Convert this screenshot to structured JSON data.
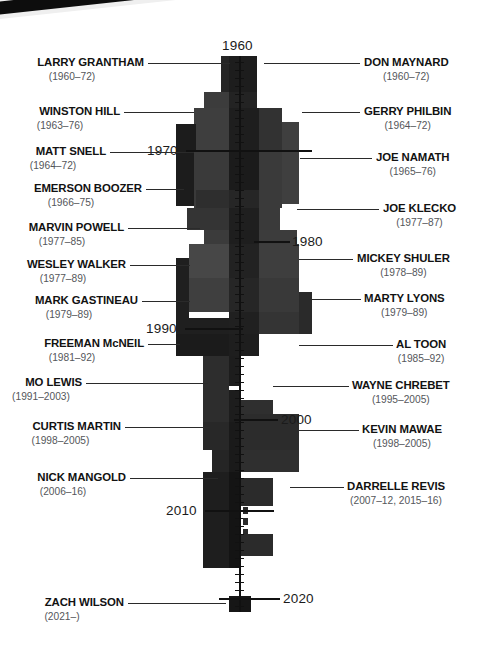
{
  "meta": {
    "domain": "chart",
    "background": "#ffffff",
    "accent": "#111111"
  },
  "chart_data": {
    "type": "area",
    "title": "",
    "xlabel": "",
    "ylabel": "Year",
    "orientation": "vertical-stream",
    "axis_years": [
      {
        "label": "1960",
        "side": "top",
        "y": 45
      },
      {
        "label": "1970",
        "side": "left",
        "y": 150
      },
      {
        "label": "1980",
        "side": "right",
        "y": 241
      },
      {
        "label": "1990",
        "side": "left",
        "y": 328
      },
      {
        "label": "2000",
        "side": "right",
        "y": 419
      },
      {
        "label": "2010",
        "side": "left",
        "y": 510
      },
      {
        "label": "2020",
        "side": "right",
        "y": 598
      }
    ],
    "ylim": [
      1960,
      2022
    ],
    "grid": false,
    "legend": "none",
    "series_note": "stacked career-span stream, widths in px",
    "bands": [
      {
        "x": 229,
        "y": 56,
        "w": 28,
        "h": 36,
        "c": "#1d1d1d"
      },
      {
        "x": 221,
        "y": 56,
        "w": 8,
        "h": 36,
        "c": "#252525"
      },
      {
        "x": 229,
        "y": 92,
        "w": 28,
        "h": 16,
        "c": "#232323"
      },
      {
        "x": 204,
        "y": 92,
        "w": 25,
        "h": 16,
        "c": "#3c3c3c"
      },
      {
        "x": 257,
        "y": 108,
        "w": 25,
        "h": 16,
        "c": "#3a3a3a"
      },
      {
        "x": 194,
        "y": 108,
        "w": 35,
        "h": 44,
        "c": "#3e3e3e"
      },
      {
        "x": 229,
        "y": 108,
        "w": 30,
        "h": 44,
        "c": "#1e1e1e"
      },
      {
        "x": 259,
        "y": 108,
        "w": 23,
        "h": 44,
        "c": "#323232"
      },
      {
        "x": 282,
        "y": 122,
        "w": 17,
        "h": 82,
        "c": "#3f3f3f"
      },
      {
        "x": 176,
        "y": 124,
        "w": 20,
        "h": 82,
        "c": "#1c1c1c"
      },
      {
        "x": 194,
        "y": 152,
        "w": 35,
        "h": 56,
        "c": "#3a3a3a"
      },
      {
        "x": 229,
        "y": 152,
        "w": 30,
        "h": 38,
        "c": "#1b1b1b"
      },
      {
        "x": 259,
        "y": 152,
        "w": 23,
        "h": 56,
        "c": "#3a3a3a"
      },
      {
        "x": 196,
        "y": 190,
        "w": 33,
        "h": 18,
        "c": "#2e2e2e"
      },
      {
        "x": 229,
        "y": 190,
        "w": 30,
        "h": 18,
        "c": "#262626"
      },
      {
        "x": 187,
        "y": 208,
        "w": 42,
        "h": 22,
        "c": "#343434"
      },
      {
        "x": 229,
        "y": 208,
        "w": 30,
        "h": 22,
        "c": "#1f1f1f"
      },
      {
        "x": 259,
        "y": 208,
        "w": 21,
        "h": 22,
        "c": "#3a3a3a"
      },
      {
        "x": 204,
        "y": 230,
        "w": 25,
        "h": 14,
        "c": "#3b3b3b"
      },
      {
        "x": 229,
        "y": 230,
        "w": 30,
        "h": 14,
        "c": "#1e1e1e"
      },
      {
        "x": 259,
        "y": 230,
        "w": 38,
        "h": 14,
        "c": "#3c3c3c"
      },
      {
        "x": 189,
        "y": 244,
        "w": 40,
        "h": 34,
        "c": "#474747"
      },
      {
        "x": 229,
        "y": 244,
        "w": 30,
        "h": 34,
        "c": "#222222"
      },
      {
        "x": 259,
        "y": 244,
        "w": 40,
        "h": 34,
        "c": "#3e3e3e"
      },
      {
        "x": 176,
        "y": 258,
        "w": 13,
        "h": 60,
        "c": "#1f1f1f"
      },
      {
        "x": 189,
        "y": 278,
        "w": 40,
        "h": 34,
        "c": "#3f3f3f"
      },
      {
        "x": 229,
        "y": 278,
        "w": 30,
        "h": 34,
        "c": "#262626"
      },
      {
        "x": 259,
        "y": 278,
        "w": 40,
        "h": 34,
        "c": "#393939"
      },
      {
        "x": 299,
        "y": 292,
        "w": 13,
        "h": 42,
        "c": "#2a2a2a"
      },
      {
        "x": 176,
        "y": 318,
        "w": 53,
        "h": 16,
        "c": "#1f1f1f"
      },
      {
        "x": 229,
        "y": 312,
        "w": 30,
        "h": 22,
        "c": "#202020"
      },
      {
        "x": 259,
        "y": 312,
        "w": 40,
        "h": 22,
        "c": "#343434"
      },
      {
        "x": 176,
        "y": 334,
        "w": 53,
        "h": 22,
        "c": "#1b1b1b"
      },
      {
        "x": 229,
        "y": 334,
        "w": 30,
        "h": 22,
        "c": "#1e1e1e"
      },
      {
        "x": 203,
        "y": 356,
        "w": 26,
        "h": 66,
        "c": "#2d2d2d"
      },
      {
        "x": 229,
        "y": 356,
        "w": 12,
        "h": 30,
        "c": "#1d1d1d"
      },
      {
        "x": 229,
        "y": 390,
        "w": 12,
        "h": 32,
        "c": "#1d1d1d"
      },
      {
        "x": 241,
        "y": 400,
        "w": 32,
        "h": 22,
        "c": "#2f2f2f"
      },
      {
        "x": 203,
        "y": 422,
        "w": 26,
        "h": 28,
        "c": "#282828"
      },
      {
        "x": 229,
        "y": 422,
        "w": 12,
        "h": 28,
        "c": "#1a1a1a"
      },
      {
        "x": 241,
        "y": 414,
        "w": 58,
        "h": 36,
        "c": "#2c2c2c"
      },
      {
        "x": 212,
        "y": 450,
        "w": 17,
        "h": 22,
        "c": "#252525"
      },
      {
        "x": 229,
        "y": 450,
        "w": 12,
        "h": 22,
        "c": "#1a1a1a"
      },
      {
        "x": 241,
        "y": 450,
        "w": 58,
        "h": 22,
        "c": "#2f2f2f"
      },
      {
        "x": 203,
        "y": 472,
        "w": 26,
        "h": 96,
        "c": "#1e1e1e"
      },
      {
        "x": 229,
        "y": 472,
        "w": 12,
        "h": 96,
        "c": "#141414"
      },
      {
        "x": 241,
        "y": 478,
        "w": 32,
        "h": 28,
        "c": "#2b2b2b"
      },
      {
        "x": 241,
        "y": 506,
        "w": 10,
        "h": 24,
        "c": "#ffffff"
      },
      {
        "x": 241,
        "y": 534,
        "w": 32,
        "h": 22,
        "c": "#2b2b2b"
      },
      {
        "x": 229,
        "y": 596,
        "w": 22,
        "h": 16,
        "c": "#161616"
      }
    ],
    "dashes": [
      {
        "x": 243,
        "y": 507,
        "w": 5,
        "h": 7
      },
      {
        "x": 243,
        "y": 518,
        "w": 5,
        "h": 7
      },
      {
        "x": 243,
        "y": 529,
        "w": 5,
        "h": 5
      }
    ],
    "ticks_y": [
      62,
      70,
      78,
      86,
      94,
      102,
      110,
      118,
      126,
      134,
      142,
      150,
      158,
      166,
      174,
      182,
      190,
      198,
      206,
      214,
      222,
      230,
      238,
      246,
      254,
      262,
      270,
      278,
      286,
      294,
      302,
      310,
      318,
      326,
      334,
      342,
      350,
      358,
      366,
      374,
      382,
      390,
      398,
      406,
      414,
      422,
      430,
      438,
      446,
      454,
      462,
      470,
      478,
      486,
      494,
      502,
      510,
      518,
      526,
      534,
      542,
      550,
      558,
      566,
      574,
      582,
      590,
      598,
      606
    ]
  },
  "players_left": [
    {
      "name": "LARRY GRANTHAM",
      "years": "(1960–72)",
      "y": 63,
      "label_x": 20,
      "leader_x": 148,
      "leader_w": 82,
      "name_right": 144
    },
    {
      "name": "WINSTON HILL",
      "years": "(1963–76)",
      "y": 112,
      "label_x": 20,
      "leader_x": 124,
      "leader_w": 70,
      "name_right": 120
    },
    {
      "name": "MATT SNELL",
      "years": "(1964–72)",
      "y": 152,
      "label_x": 20,
      "leader_x": 110,
      "leader_w": 84,
      "name_right": 106
    },
    {
      "name": "EMERSON BOOZER",
      "years": "(1966–75)",
      "y": 189,
      "label_x": 20,
      "leader_x": 146,
      "leader_w": 38,
      "name_right": 142
    },
    {
      "name": "MARVIN POWELL",
      "years": "(1977–85)",
      "y": 228,
      "label_x": 20,
      "leader_x": 128,
      "leader_w": 72,
      "name_right": 124
    },
    {
      "name": "WESLEY WALKER",
      "years": "(1977–89)",
      "y": 265,
      "label_x": 20,
      "leader_x": 130,
      "leader_w": 60,
      "name_right": 126
    },
    {
      "name": "MARK GASTINEAU",
      "years": "(1979–89)",
      "y": 301,
      "label_x": 20,
      "leader_x": 142,
      "leader_w": 48,
      "name_right": 138
    },
    {
      "name": "FREEMAN McNEIL",
      "years": "(1981–92)",
      "y": 344,
      "label_x": 20,
      "leader_x": 148,
      "leader_w": 32,
      "name_right": 144
    },
    {
      "name": "MO LEWIS",
      "years": "(1991–2003)",
      "y": 383,
      "label_x": 20,
      "leader_x": 86,
      "leader_w": 122,
      "name_right": 82
    },
    {
      "name": "CURTIS MARTIN",
      "years": "(1998–2005)",
      "y": 427,
      "label_x": 20,
      "leader_x": 125,
      "leader_w": 85,
      "name_right": 121
    },
    {
      "name": "NICK MANGOLD",
      "years": "(2006–16)",
      "y": 478,
      "label_x": 20,
      "leader_x": 130,
      "leader_w": 88,
      "name_right": 126
    },
    {
      "name": "ZACH WILSON",
      "years": "(2021–)",
      "y": 603,
      "label_x": 20,
      "leader_x": 128,
      "leader_w": 98,
      "name_right": 124
    }
  ],
  "players_right": [
    {
      "name": "DON MAYNARD",
      "years": "(1960–72)",
      "y": 63,
      "label_x": 364,
      "leader_x": 264,
      "leader_w": 96
    },
    {
      "name": "GERRY PHILBIN",
      "years": "(1964–72)",
      "y": 112,
      "label_x": 364,
      "leader_x": 302,
      "leader_w": 58
    },
    {
      "name": "JOE NAMATH",
      "years": "(1965–76)",
      "y": 158,
      "label_x": 376,
      "leader_x": 300,
      "leader_w": 72
    },
    {
      "name": "JOE KLECKO",
      "years": "(1977–87)",
      "y": 209,
      "label_x": 383,
      "leader_x": 297,
      "leader_w": 82
    },
    {
      "name": "MICKEY SHULER",
      "years": "(1978–89)",
      "y": 259,
      "label_x": 357,
      "leader_x": 299,
      "leader_w": 54
    },
    {
      "name": "MARTY LYONS",
      "years": "(1979–89)",
      "y": 299,
      "label_x": 364,
      "leader_x": 299,
      "leader_w": 62
    },
    {
      "name": "AL TOON",
      "years": "(1985–92)",
      "y": 345,
      "label_x": 396,
      "leader_x": 299,
      "leader_w": 94
    },
    {
      "name": "WAYNE CHREBET",
      "years": "(1995–2005)",
      "y": 386,
      "label_x": 352,
      "leader_x": 273,
      "leader_w": 76
    },
    {
      "name": "KEVIN MAWAE",
      "years": "(1998–2005)",
      "y": 430,
      "label_x": 362,
      "leader_x": 299,
      "leader_w": 60
    },
    {
      "name": "DARRELLE REVIS",
      "years": "(2007–12, 2015–16)",
      "y": 487,
      "label_x": 347,
      "leader_x": 290,
      "leader_w": 54
    }
  ],
  "years_axis": [
    {
      "label": "1960",
      "x": 222,
      "y": 38,
      "rule_x": 0,
      "rule_w": 0,
      "rule_y": 0
    },
    {
      "label": "1970",
      "x": 147,
      "y": 143,
      "rule_x": 186,
      "rule_w": 126,
      "rule_y": 150
    },
    {
      "label": "1980",
      "x": 292,
      "y": 234,
      "rule_x": 254,
      "rule_w": 36,
      "rule_y": 241
    },
    {
      "label": "1990",
      "x": 146,
      "y": 321,
      "rule_x": 185,
      "rule_w": 58,
      "rule_y": 328
    },
    {
      "label": "2000",
      "x": 281,
      "y": 412,
      "rule_x": 234,
      "rule_w": 44,
      "rule_y": 419
    },
    {
      "label": "2010",
      "x": 166,
      "y": 503,
      "rule_x": 205,
      "rule_w": 69,
      "rule_y": 510
    },
    {
      "label": "2020",
      "x": 283,
      "y": 591,
      "rule_x": 219,
      "rule_w": 61,
      "rule_y": 598
    }
  ]
}
